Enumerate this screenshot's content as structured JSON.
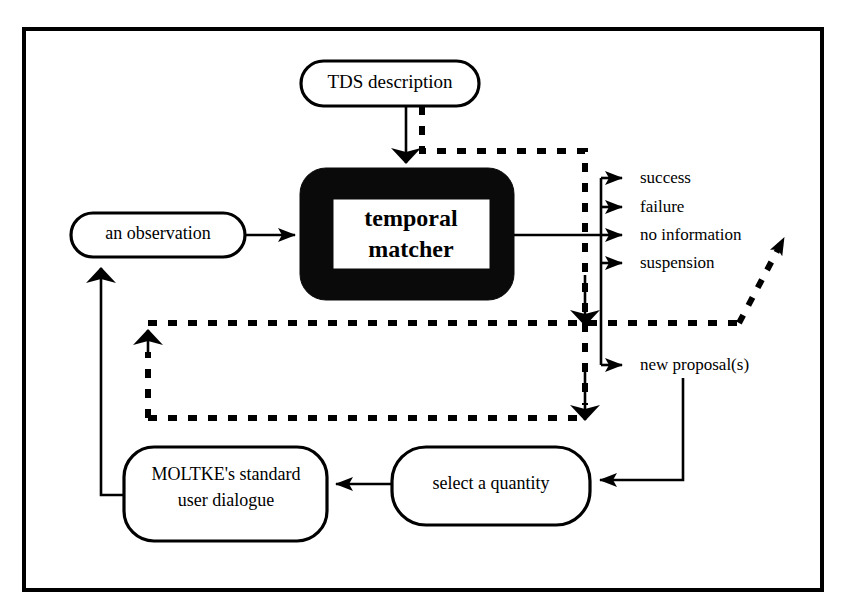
{
  "figure": {
    "title_fragment_top": "",
    "frame": {
      "x": 24,
      "y": 29,
      "width": 798,
      "height": 561,
      "stroke": "#000000"
    }
  },
  "colors": {
    "ink": "#000000",
    "paper": "#ffffff",
    "matcher_fill": "#0a0a0a"
  },
  "nodes": {
    "tds_description": {
      "label": "TDS description",
      "shape": "rounded-rect"
    },
    "temporal_matcher": {
      "label_line1": "temporal",
      "label_line2": "matcher",
      "shape": "thick-black-rounded-rect"
    },
    "an_observation": {
      "label": "an observation",
      "shape": "rounded-rect"
    },
    "moltke_dialogue": {
      "label_line1": "MOLTKE's standard",
      "label_line2": "user dialogue",
      "shape": "rounded-rect"
    },
    "select_quantity": {
      "label": "select a quantity",
      "shape": "rounded-rect"
    }
  },
  "outputs": {
    "items": [
      {
        "label": "success"
      },
      {
        "label": "failure"
      },
      {
        "label": "no information"
      },
      {
        "label": "suspension"
      },
      {
        "label": "new proposal(s)"
      }
    ]
  },
  "edges": {
    "legend": [
      {
        "style": "solid",
        "from": "TDS description",
        "to": "temporal matcher"
      },
      {
        "style": "solid",
        "from": "an observation",
        "to": "temporal matcher"
      },
      {
        "style": "solid",
        "from": "temporal matcher",
        "to": "outputs"
      },
      {
        "style": "solid",
        "from": "new proposal(s)",
        "to": "select a quantity"
      },
      {
        "style": "solid",
        "from": "select a quantity",
        "to": "MOLTKE's standard user dialogue"
      },
      {
        "style": "solid",
        "from": "MOLTKE's standard user dialogue",
        "to": "an observation"
      },
      {
        "style": "dashed",
        "from": "TDS description",
        "to": "control loop"
      },
      {
        "style": "dashed",
        "from": "control loop",
        "to": "diagonal exit"
      }
    ]
  }
}
